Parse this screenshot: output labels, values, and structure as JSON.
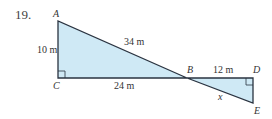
{
  "problem_number": "19.",
  "vertices": {
    "A": "A",
    "B": "B",
    "C": "C",
    "D": "D",
    "E": "E"
  },
  "measurements": {
    "AC": "10 m",
    "AB": "34 m",
    "CB": "24 m",
    "BD": "12 m",
    "BE": "x"
  },
  "colors": {
    "fill": "#cfe9f5",
    "stroke": "#2a3340"
  }
}
